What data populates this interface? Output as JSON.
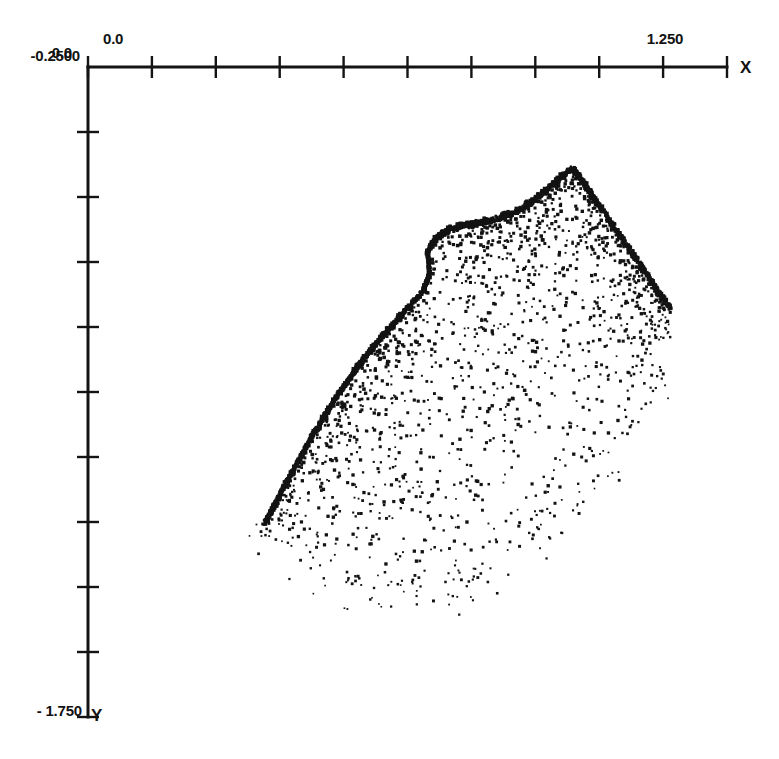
{
  "figure": {
    "title": "",
    "background_color": "#ffffff",
    "ink_color": "#131313"
  },
  "axes": {
    "x_axis": {
      "name": "X",
      "label_min": "0.0",
      "label_max": "1.250",
      "min": 0.0,
      "max": 1.25,
      "tick_count": 11,
      "position": "top"
    },
    "y_axis": {
      "name": "Y",
      "label_max": "-0.2500",
      "label_min": "- 1.750",
      "min": -1.75,
      "max": -0.25,
      "tick_count": 11,
      "position": "left",
      "direction": "downward"
    }
  },
  "chart_data": {
    "type": "scatter",
    "title": "",
    "xlabel": "X",
    "ylabel": "Y",
    "xlim": [
      0.0,
      1.25
    ],
    "ylim": [
      -1.75,
      -0.25
    ],
    "grid": false,
    "legend": null,
    "marker": "dot",
    "marker_color": "#131313",
    "point_count_approx": 2600,
    "x_tick_labels": [
      "0.0",
      "",
      "",
      "",
      "",
      "",
      "",
      "",
      "",
      "1.250",
      ""
    ],
    "y_tick_labels": [
      "-0.2500",
      "",
      "",
      "",
      "",
      "",
      "",
      "",
      "",
      "",
      "- 1.750"
    ],
    "features": {
      "cusp_peak": {
        "x": 0.945,
        "y": -0.477
      },
      "lobe_notch": {
        "x": 0.669,
        "y": -0.718
      },
      "tail_tip": {
        "x": 0.346,
        "y": -1.295
      },
      "right_extent": {
        "x": 1.176,
        "y": -0.8
      },
      "lowest_point": {
        "x": 0.29,
        "y": -1.465
      }
    },
    "upper_boundary": [
      [
        0.346,
        -1.295
      ],
      [
        0.389,
        -1.2
      ],
      [
        0.436,
        -1.1
      ],
      [
        0.483,
        -1.01
      ],
      [
        0.53,
        -0.93
      ],
      [
        0.577,
        -0.862
      ],
      [
        0.62,
        -0.806
      ],
      [
        0.656,
        -0.76
      ],
      [
        0.669,
        -0.718
      ],
      [
        0.664,
        -0.672
      ],
      [
        0.678,
        -0.64
      ],
      [
        0.706,
        -0.618
      ],
      [
        0.744,
        -0.606
      ],
      [
        0.789,
        -0.598
      ],
      [
        0.83,
        -0.58
      ],
      [
        0.866,
        -0.556
      ],
      [
        0.9,
        -0.524
      ],
      [
        0.93,
        -0.492
      ],
      [
        0.945,
        -0.477
      ],
      [
        0.963,
        -0.498
      ],
      [
        0.99,
        -0.546
      ],
      [
        1.022,
        -0.6
      ],
      [
        1.058,
        -0.66
      ],
      [
        1.09,
        -0.716
      ],
      [
        1.118,
        -0.766
      ],
      [
        1.14,
        -0.8
      ]
    ],
    "lower_boundary": [
      [
        0.346,
        -1.295
      ],
      [
        0.4,
        -1.33
      ],
      [
        0.46,
        -1.37
      ],
      [
        0.52,
        -1.4
      ],
      [
        0.6,
        -1.42
      ],
      [
        0.7,
        -1.4
      ],
      [
        0.8,
        -1.34
      ],
      [
        0.9,
        -1.26
      ],
      [
        1.0,
        -1.14
      ],
      [
        1.08,
        -1.01
      ],
      [
        1.14,
        -0.88
      ]
    ]
  },
  "geometry_px": {
    "origin": {
      "x": 88,
      "y": 67
    },
    "x_axis_end": 727,
    "y_axis_end": 717,
    "tick_spacing_x": 63.9,
    "tick_spacing_y": 65.0,
    "tick_length": 11
  }
}
